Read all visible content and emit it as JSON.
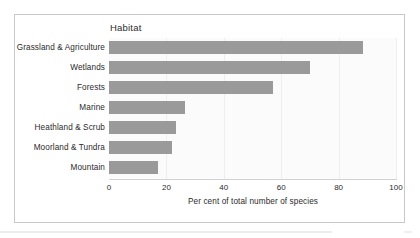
{
  "chart_data": {
    "type": "bar",
    "orientation": "horizontal",
    "title": "Habitat",
    "xlabel": "Per cent of total number of species",
    "ylabel": "",
    "categories": [
      "Grassland & Agriculture",
      "Wetlands",
      "Forests",
      "Marine",
      "Heathland & Scrub",
      "Moorland & Tundra",
      "Mountain"
    ],
    "values": [
      88.5,
      70,
      57,
      26.5,
      23.5,
      22,
      17
    ],
    "xlim": [
      0,
      100
    ],
    "xticks": [
      0,
      20,
      40,
      60,
      80,
      100
    ],
    "xtick_labels": [
      "0",
      "20",
      "40",
      "60",
      "80",
      "100"
    ],
    "grid": true,
    "legend": "none",
    "bar_color": "#9a9a9a",
    "plot_background": "#fbfbfb",
    "frame_color": "#c9c9c9",
    "text_color": "#2b2b2b"
  }
}
